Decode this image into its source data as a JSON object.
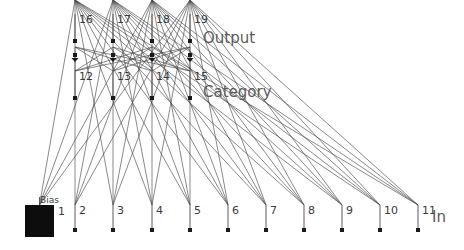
{
  "diagram": {
    "colors": {
      "background": "#ffffff",
      "line": "#4a4a4a",
      "node": "#1a1a1a",
      "text": "#3b3b3b",
      "layer_text": "#5a5a5a"
    },
    "layers": [
      {
        "name": "output",
        "label": "Output",
        "label_x": 203,
        "label_y": 43,
        "y": 41,
        "arrow_y": 57,
        "stem_top": 14,
        "nodes": [
          {
            "id": "16",
            "x": 75
          },
          {
            "id": "17",
            "x": 113
          },
          {
            "id": "18",
            "x": 152
          },
          {
            "id": "19",
            "x": 190
          }
        ]
      },
      {
        "name": "category",
        "label": "Category",
        "label_x": 203,
        "label_y": 97,
        "y": 98,
        "stem_top": 71,
        "nodes": [
          {
            "id": "12",
            "x": 75
          },
          {
            "id": "13",
            "x": 113
          },
          {
            "id": "14",
            "x": 152
          },
          {
            "id": "15",
            "x": 190
          }
        ]
      },
      {
        "name": "input",
        "label": "In",
        "label_x": 432,
        "label_y": 222,
        "y": 230,
        "stem_top": 205,
        "nodes": [
          {
            "id": "1",
            "x": 38,
            "bias": true
          },
          {
            "id": "2",
            "x": 75
          },
          {
            "id": "3",
            "x": 113
          },
          {
            "id": "4",
            "x": 152
          },
          {
            "id": "5",
            "x": 190
          },
          {
            "id": "6",
            "x": 228
          },
          {
            "id": "7",
            "x": 266
          },
          {
            "id": "8",
            "x": 304
          },
          {
            "id": "9",
            "x": 342
          },
          {
            "id": "10",
            "x": 380
          },
          {
            "id": "11",
            "x": 418
          }
        ]
      }
    ],
    "bias": {
      "label": "Bias",
      "number": "1",
      "x": 25,
      "y": 205,
      "width": 29,
      "height": 32,
      "label_x": 40,
      "label_y": 203,
      "number_x": 58,
      "number_y": 215
    },
    "node_marker": {
      "size": 4
    },
    "connections": {
      "category_to_output": "fully-connected",
      "input_to_category": "fully-connected"
    }
  }
}
